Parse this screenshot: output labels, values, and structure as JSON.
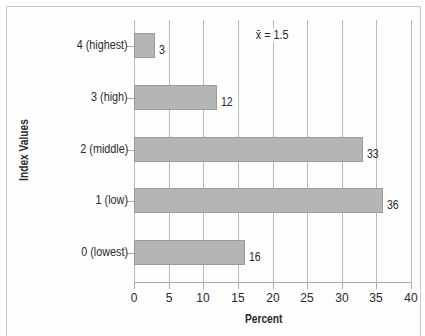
{
  "chart_data": {
    "type": "bar",
    "orientation": "horizontal",
    "title": "",
    "categories": [
      "4 (highest)",
      "3 (high)",
      "2 (middle)",
      "1 (low)",
      "0 (lowest)"
    ],
    "values": [
      3,
      12,
      33,
      36,
      16
    ],
    "value_labels": [
      "3",
      "12",
      "33",
      "36",
      "16"
    ],
    "xlabel": "Percent",
    "ylabel": "Index Values",
    "xlim": [
      0,
      40
    ],
    "xticks": [
      "0",
      "5",
      "10",
      "15",
      "20",
      "25",
      "30",
      "35",
      "40"
    ],
    "grid": "vertical",
    "annotation": "x̄ = 1.5",
    "bar_color": "#b5b5b5",
    "legend": null
  }
}
